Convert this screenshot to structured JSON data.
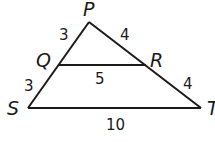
{
  "diagram": {
    "type": "triangle-with-midsegment",
    "stroke_color": "#1a1a1a",
    "vertices": {
      "P": {
        "label": "P",
        "x": 89,
        "y": 22
      },
      "Q": {
        "label": "Q",
        "x": 59,
        "y": 65
      },
      "R": {
        "label": "R",
        "x": 146,
        "y": 65
      },
      "S": {
        "label": "S",
        "x": 28,
        "y": 108
      },
      "T": {
        "label": "T",
        "x": 201,
        "y": 108
      }
    },
    "segments": [
      {
        "name": "PQ",
        "length_label": "3"
      },
      {
        "name": "QS",
        "length_label": "3"
      },
      {
        "name": "PR",
        "length_label": "4"
      },
      {
        "name": "RT",
        "length_label": "4"
      },
      {
        "name": "QR",
        "length_label": "5"
      },
      {
        "name": "ST",
        "length_label": "10"
      }
    ]
  }
}
